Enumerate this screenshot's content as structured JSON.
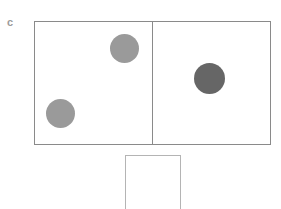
{
  "figure": {
    "panel_label": "c",
    "width": 281,
    "height": 209,
    "background_color": "#ffffff"
  },
  "arena": {
    "name": "two-compartment-arena",
    "x": 34,
    "y": 21,
    "width": 237,
    "height": 124,
    "border_color": "#8a8a8a",
    "border_width": 1,
    "fill_color": "#ffffff",
    "divider": {
      "name": "center-divider",
      "x": 152,
      "orientation": "vertical",
      "color": "#8a8a8a",
      "width": 1
    },
    "compartments": [
      {
        "id": "left",
        "label": "left-compartment"
      },
      {
        "id": "right",
        "label": "right-compartment"
      }
    ]
  },
  "objects": [
    {
      "id": "disc-top-left",
      "name": "light-gray-disc-upper",
      "compartment": "left",
      "cx": 124,
      "cy": 48,
      "diameter": 29,
      "fill_color": "#9a9a9a",
      "shade": "light"
    },
    {
      "id": "disc-bottom-left",
      "name": "light-gray-disc-lower",
      "compartment": "left",
      "cx": 60,
      "cy": 113,
      "diameter": 29,
      "fill_color": "#9a9a9a",
      "shade": "light"
    },
    {
      "id": "disc-right",
      "name": "dark-gray-disc",
      "compartment": "right",
      "cx": 209,
      "cy": 78,
      "diameter": 31,
      "fill_color": "#666666",
      "shade": "dark"
    }
  ],
  "sub_box": {
    "name": "lower-partial-box",
    "x": 125,
    "y": 155,
    "width": 56,
    "height": 56,
    "border_color": "#b4b4b4",
    "border_width": 1,
    "fill_color": "#ffffff",
    "note": "clipped at bottom edge of frame"
  }
}
